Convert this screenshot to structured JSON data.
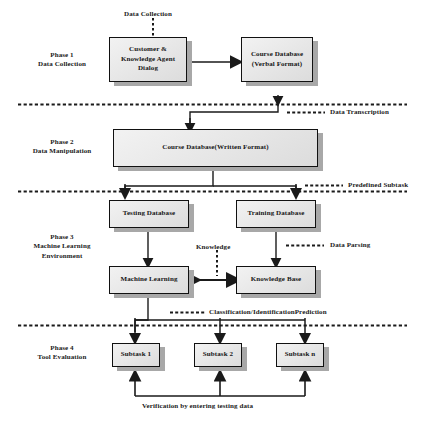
{
  "diagram": {
    "phases": [
      {
        "id": "phase-1",
        "label": "Phase 1\nData Collection"
      },
      {
        "id": "phase-2",
        "label": "Phase 2\nData Manipulation"
      },
      {
        "id": "phase-3",
        "label": "Phase 3\nMachine Learning\nEnvironment"
      },
      {
        "id": "phase-4",
        "label": "Phase 4\nTool Evaluation"
      }
    ],
    "nodes": [
      {
        "id": "customer-knowledge-agent-dialog",
        "label": "Customer &\nKnowledge Agent\nDialog"
      },
      {
        "id": "course-database-verbal",
        "label": "Course Database\n(Verbal Format)"
      },
      {
        "id": "course-database-written",
        "label": "Course Database(Written Format)"
      },
      {
        "id": "testing-database",
        "label": "Testing Database"
      },
      {
        "id": "training-database",
        "label": "Training Database"
      },
      {
        "id": "machine-learning",
        "label": "Machine Learning"
      },
      {
        "id": "knowledge-base",
        "label": "Knowledge Base"
      },
      {
        "id": "subtask-1",
        "label": "Subtask 1"
      },
      {
        "id": "subtask-2",
        "label": "Subtask 2"
      },
      {
        "id": "subtask-n",
        "label": "Subtask n"
      }
    ],
    "edge_labels": [
      {
        "id": "data-collection",
        "label": "Data Collection"
      },
      {
        "id": "data-transcription",
        "label": "Data Transcription"
      },
      {
        "id": "predefined-subtask",
        "label": "Predefined Subtask"
      },
      {
        "id": "data-parsing",
        "label": "Data Parsing"
      },
      {
        "id": "knowledge",
        "label": "Knowledge"
      },
      {
        "id": "classification-identification-prediction",
        "label": "Classification/IdentificationPrediction"
      },
      {
        "id": "verification",
        "label": "Verification by entering testing data"
      }
    ],
    "colors": {
      "node_fill": "#e9e9e9",
      "node_border": "#111111",
      "node_shadow": "#a8a8a8",
      "line": "#1a1a1a",
      "text": "#151515",
      "background": "#ffffff"
    }
  }
}
